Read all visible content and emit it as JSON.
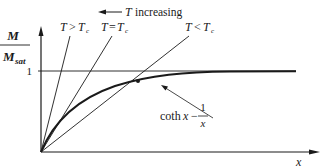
{
  "diagram": {
    "type": "magnetization_vs_x",
    "y_axis_label": {
      "numerator": "M",
      "denominator": "M",
      "denominator_sub": "sat"
    },
    "x_axis_label": "x",
    "y_tick_label": "1",
    "direction_annotation": {
      "arrow": "←",
      "symbol": "T",
      "text": "increasing"
    },
    "lines": [
      {
        "label_lhs": "T",
        "relation": ">",
        "label_rhs": "T",
        "sub": "c"
      },
      {
        "label_lhs": "T",
        "relation": "=",
        "label_rhs": "T",
        "sub": "c"
      },
      {
        "label_lhs": "T",
        "relation": "<",
        "label_rhs": "T",
        "sub": "c"
      }
    ],
    "curve_label": {
      "func": "coth",
      "var": "x",
      "minus": "−",
      "frac_num": "1",
      "frac_den": "x"
    },
    "colors": {
      "ink": "#1a1a1a",
      "background": "#ffffff"
    }
  }
}
